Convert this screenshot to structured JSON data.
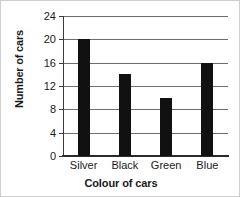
{
  "chart_data": {
    "type": "bar",
    "title": "",
    "xlabel": "Colour of cars",
    "ylabel": "Number of cars",
    "categories": [
      "Silver",
      "Black",
      "Green",
      "Blue"
    ],
    "values": [
      20,
      14,
      10,
      16
    ],
    "ylim": [
      0,
      24
    ],
    "yticks": [
      0,
      4,
      8,
      12,
      16,
      20,
      24
    ],
    "ytick_labels": [
      "0",
      "4",
      "8",
      "12",
      "16",
      "20",
      "24"
    ],
    "grid": true,
    "grid_axis": "y",
    "legend": false,
    "bar_color": "#111111",
    "grid_color": "#6e6e6e",
    "axis_color": "#2b2b2b",
    "text_color": "#1a1a1a",
    "background": "#ffffff"
  }
}
